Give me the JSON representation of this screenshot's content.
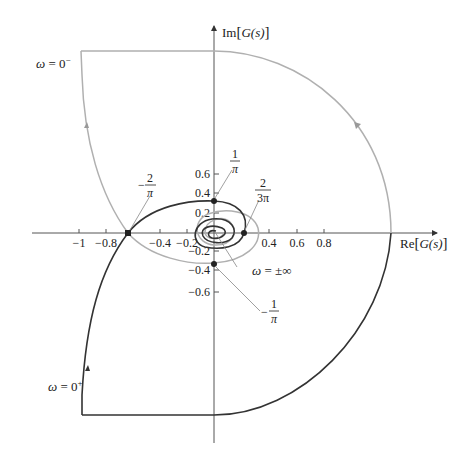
{
  "figure": {
    "type": "nyquist-plot",
    "x_axis": {
      "label_prefix": "Re",
      "label_open": "[",
      "label_func": "G(s)",
      "label_close": "]",
      "ticks": [
        {
          "value": -1,
          "label": "−1"
        },
        {
          "value": -0.8,
          "label": "−0.8"
        },
        {
          "value": -0.4,
          "label": "−0.4"
        },
        {
          "value": -0.2,
          "label": "−0.2"
        },
        {
          "value": 0.4,
          "label": "0.4"
        },
        {
          "value": 0.6,
          "label": "0.6"
        },
        {
          "value": 0.8,
          "label": "0.8"
        }
      ]
    },
    "y_axis": {
      "label_prefix": "Im",
      "label_open": "[",
      "label_func": "G(s)",
      "label_close": "]",
      "ticks": [
        {
          "value": 0.6,
          "label": "0.6"
        },
        {
          "value": 0.4,
          "label": "0.4"
        },
        {
          "value": 0.2,
          "label": "0.2"
        },
        {
          "value": -0.2,
          "label": "−0.2"
        },
        {
          "value": -0.4,
          "label": "−0.4"
        },
        {
          "value": -0.6,
          "label": "−0.6"
        }
      ]
    },
    "annotations": {
      "omega_0_minus": {
        "omega": "ω",
        "eq": " = 0",
        "sup": "−"
      },
      "omega_0_plus": {
        "omega": "ω",
        "eq": " = 0",
        "sup": "+"
      },
      "omega_inf": {
        "omega": "ω",
        "eq": " = ±∞"
      },
      "neg_2_over_pi": {
        "sign": "−",
        "num": "2",
        "den": "π"
      },
      "one_over_pi": {
        "num": "1",
        "den": "π"
      },
      "two_over_3pi": {
        "num": "2",
        "den": "3π"
      },
      "neg_1_over_pi": {
        "sign": "−",
        "num": "1",
        "den": "π"
      }
    },
    "colors": {
      "positive_freq_curve": "#333333",
      "negative_freq_curve": "#b0b0b0",
      "axis": "#555555"
    }
  }
}
